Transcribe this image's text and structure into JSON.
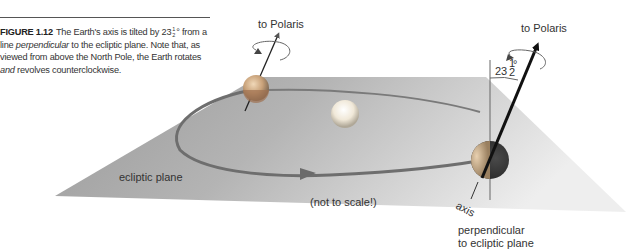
{
  "caption": {
    "figure_label": "FIGURE 1.12",
    "text_part1": "The Earth's axis is tilted by 23",
    "frac_num": "1",
    "frac_den": "2",
    "text_part2": "° from a line ",
    "emph1": "perpendicular",
    "text_part3": " to the ecliptic plane. Note that, as viewed from above the North Pole, the Earth rotates ",
    "emph2": "and",
    "text_part4": " revolves counterclockwise."
  },
  "diagram": {
    "labels": {
      "polaris_left": "to Polaris",
      "polaris_right": "to Polaris",
      "tilt_angle_whole": "23",
      "tilt_angle_num": "1",
      "tilt_angle_den": "2",
      "tilt_angle_deg": "°",
      "ecliptic_plane": "ecliptic plane",
      "not_to_scale": "(not to scale!)",
      "axis": "axis",
      "perpendicular_line1": "perpendicular",
      "perpendicular_line2": "to ecliptic plane"
    },
    "colors": {
      "plane_dark": "#8a8a8a",
      "plane_light": "#e6e6e6",
      "orbit": "#6a6a6a",
      "earth_dark": "#3a3a3a",
      "sun": "#f2f2f2"
    }
  }
}
